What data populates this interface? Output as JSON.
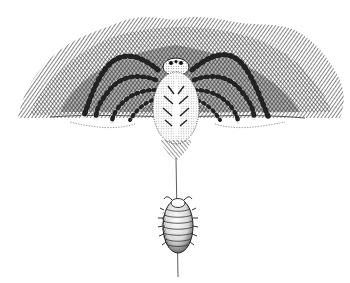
{
  "image": {
    "kind": "pen-and-ink illustration",
    "subject": "spider lowering prey on a silk thread",
    "elements": [
      {
        "name": "hatched-background",
        "description": "dense cross-hatched dark band behind the spider"
      },
      {
        "name": "spider",
        "description": "spider seen from above with banded legs, resting on a ledge"
      },
      {
        "name": "silk-thread",
        "description": "single vertical thread running down from the spider"
      },
      {
        "name": "woodlouse",
        "description": "segmented woodlouse hanging from the thread"
      }
    ],
    "colors": {
      "ink": "#1a1a1a",
      "paper": "#ffffff",
      "mid": "#555555"
    }
  }
}
